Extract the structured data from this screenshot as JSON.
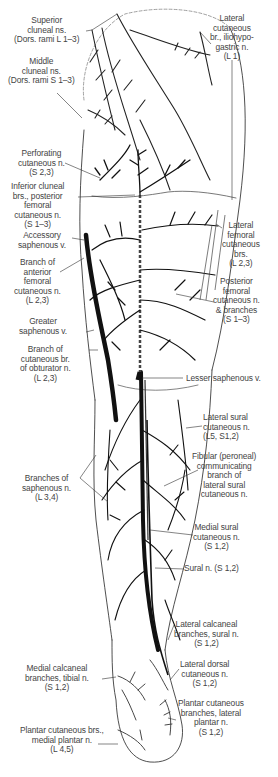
{
  "figure": {
    "view": "posterior",
    "colors": {
      "line": "#111111",
      "label_text": "#444444",
      "outline": "#222222",
      "background": "#ffffff"
    }
  },
  "labels": {
    "superior_cluneal": {
      "lines": [
        "Superior",
        "cluneal ns.",
        "(Dors. rami L 1–3)"
      ]
    },
    "middle_cluneal": {
      "lines": [
        "Middle",
        "cluneal ns.",
        "(Dors. rami S 1–3)"
      ]
    },
    "lateral_cutaneous_iliohypogastric": {
      "lines": [
        "Lateral",
        "cutaneous",
        "br., iliohypo-",
        "gastric n.",
        "(L 1)"
      ]
    },
    "perforating_cutaneous": {
      "lines": [
        "Perforating",
        "cutaneous n.",
        "(S 2,3)"
      ]
    },
    "inferior_cluneal": {
      "lines": [
        "Inferior cluneal",
        "brs., posterior",
        "femoral",
        "cutaneous n.",
        "(S 1–3)"
      ]
    },
    "accessory_saphenous": {
      "lines": [
        "Accessory",
        "saphenous v."
      ]
    },
    "branch_anterior_femoral": {
      "lines": [
        "Branch of",
        "anterior",
        "femoral",
        "cutaneous n.",
        "(L 2,3)"
      ]
    },
    "greater_saphenous": {
      "lines": [
        "Greater",
        "saphenous v."
      ]
    },
    "branch_obturator": {
      "lines": [
        "Branch of",
        "cutaneous br.",
        "of obturator n.",
        "(L 2,3)"
      ]
    },
    "lateral_femoral_cutaneous": {
      "lines": [
        "Lateral",
        "femoral",
        "cutaneous",
        "brs.",
        "(L 2,3)"
      ]
    },
    "posterior_femoral_cutaneous": {
      "lines": [
        "Posterior",
        "femoral",
        "cutaneous n.",
        "& branches",
        "(S 1–3)"
      ]
    },
    "lesser_saphenous": {
      "lines": [
        "Lesser saphenous v."
      ]
    },
    "lateral_sural_cutaneous": {
      "lines": [
        "Lateral sural",
        "cutaneous n.",
        "(L5, S1,2)"
      ]
    },
    "fibular_communicating": {
      "lines": [
        "Fibular (peroneal)",
        "communicating",
        "branch of",
        "lateral sural",
        "cutaneous n."
      ]
    },
    "branches_saphenous": {
      "lines": [
        "Branches of",
        "saphenous n.",
        "(L 3,4)"
      ]
    },
    "medial_sural_cutaneous": {
      "lines": [
        "Medial sural",
        "cutaneous n.",
        "(S 1,2)"
      ]
    },
    "sural": {
      "lines": [
        "Sural n. (S 1,2)"
      ]
    },
    "lateral_calcaneal": {
      "lines": [
        "Lateral calcaneal",
        "branches, sural n.",
        "(S 1,2)"
      ]
    },
    "medial_calcaneal": {
      "lines": [
        "Medial calcaneal",
        "branches, tibial n.",
        "(S 1,2)"
      ]
    },
    "lateral_dorsal_cutaneous": {
      "lines": [
        "Lateral dorsal",
        "cutaneous n.",
        "(S 1,2)"
      ]
    },
    "plantar_lateral": {
      "lines": [
        "Plantar cutaneous",
        "branches, lateral",
        "plantar n.",
        "(S 1,2)"
      ]
    },
    "plantar_medial": {
      "lines": [
        "Plantar cutaneous brs.,",
        "medial plantar n.",
        "(L 4,5)"
      ]
    }
  }
}
